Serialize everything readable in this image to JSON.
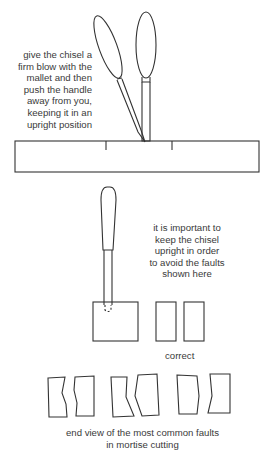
{
  "figure": {
    "step_caption": {
      "lines": [
        "give the chisel a",
        "firm blow with the",
        "mallet and then",
        "push the handle",
        "away from you,",
        "keeping it in an",
        "upright position"
      ]
    },
    "upright_caption": {
      "lines": [
        "it is important to",
        "keep the chisel",
        "upright in order",
        "to avoid the faults",
        "shown here"
      ]
    },
    "correct_label": "correct",
    "faults_caption": {
      "lines": [
        "end view of the most common faults",
        "in mortise cutting"
      ]
    }
  }
}
